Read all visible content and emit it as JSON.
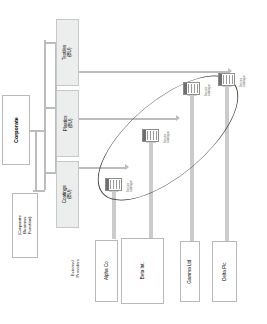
{
  "diagram": {
    "orientation": "rotated-90-ccw",
    "colors": {
      "unit_fill": "#eceded",
      "unit_border": "#c6c7c8",
      "plain_fill": "#ffffff",
      "plain_border": "#b9b9b9",
      "connector": "#bcbcbc",
      "flow_arrow": "#c9cbcc",
      "highlight_ellipse": "#3a3a3a",
      "text": "#3a3a3a"
    }
  },
  "corporate": {
    "label": "Corporate"
  },
  "corporate_function": {
    "label": "(Corporate Business Function)"
  },
  "business_units": [
    {
      "name": "textiles",
      "label": "Textiles\n(BU)",
      "line1": "Textiles",
      "line2": "(BU)"
    },
    {
      "name": "plastics",
      "label": "Plastics\n(BU)",
      "line1": "Plastics",
      "line2": "(BU)"
    },
    {
      "name": "coatings",
      "label": "Coatings\n(BU)",
      "line1": "Coatings",
      "line2": "(BU)"
    }
  ],
  "external_providers": {
    "heading_line1": "External",
    "heading_line2": "Providers",
    "items": [
      {
        "name": "alpha",
        "label": "Alpha Co"
      },
      {
        "name": "beta",
        "label": "Beta Int."
      },
      {
        "name": "gamma",
        "label": "Gamma Ltd"
      },
      {
        "name": "delta",
        "label": "Delta Plc"
      }
    ]
  },
  "service_catalogues": [
    {
      "name": "catalogue-alpha",
      "line1": "Service",
      "line2": "catalogue"
    },
    {
      "name": "catalogue-beta",
      "line1": "Service",
      "line2": "catalogue"
    },
    {
      "name": "catalogue-gamma",
      "line1": "Service",
      "line2": "catalogue"
    },
    {
      "name": "catalogue-delta",
      "line1": "Service",
      "line2": "catalogue"
    }
  ]
}
